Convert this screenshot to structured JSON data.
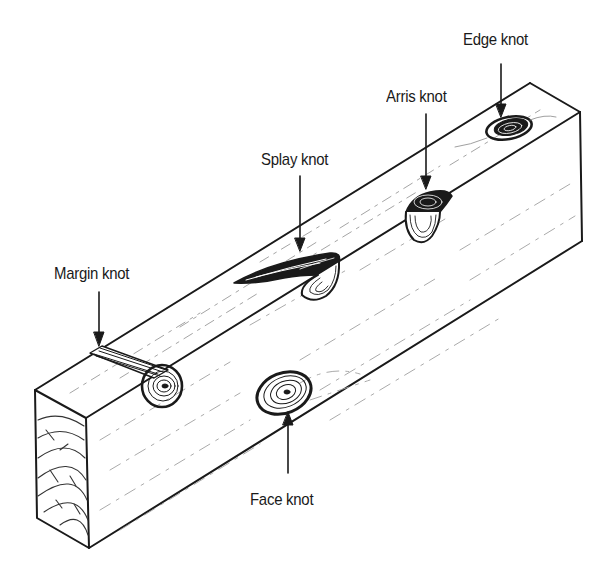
{
  "figure": {
    "labels": {
      "edge_knot": "Edge knot",
      "arris_knot": "Arris knot",
      "splay_knot": "Splay knot",
      "margin_knot": "Margin knot",
      "face_knot": "Face knot"
    },
    "colors": {
      "ink": "#1a1a1a",
      "background": "#ffffff",
      "grain": "#9a9a9a"
    }
  }
}
